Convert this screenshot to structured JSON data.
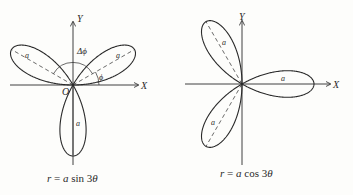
{
  "diagrams": [
    {
      "name": "rose-sin",
      "equation": "r = a sin 3θ",
      "equation_parts": {
        "r": "r",
        "eq": " = ",
        "a": "a",
        "fn": " sin 3",
        "theta": "θ"
      },
      "labels": {
        "y_axis": "Y",
        "x_axis": "X",
        "origin": "O",
        "delta_phi": "Δϕ",
        "phi": "ϕ",
        "petal_left": "a",
        "petal_right": "a",
        "petal_bottom": "a"
      },
      "petal_angles_deg": [
        30,
        150,
        270
      ]
    },
    {
      "name": "rose-cos",
      "equation": "r = a cos 3θ",
      "equation_parts": {
        "r": "r",
        "eq": " = ",
        "a": "a",
        "fn": " cos 3",
        "theta": "θ"
      },
      "labels": {
        "y_axis": "Y",
        "x_axis": "X",
        "petal_right": "a",
        "petal_upper": "a",
        "petal_lower": "a"
      },
      "petal_angles_deg": [
        0,
        120,
        240
      ]
    }
  ],
  "colors": {
    "ink": "#2a2a2a",
    "background": "#fdfdfb"
  }
}
